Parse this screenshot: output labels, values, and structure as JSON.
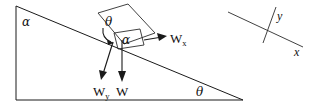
{
  "figure": {
    "background_color": "#ffffff",
    "stroke_color": "#1a1a1a",
    "width": 322,
    "height": 112
  },
  "incline": {
    "name": "inclined-plane-triangle",
    "apex_angle_label": "α",
    "base_angle_label": "θ",
    "vertices": {
      "top_left": [
        16,
        6
      ],
      "bottom_left": [
        16,
        100
      ],
      "bottom_right": [
        243,
        100
      ]
    }
  },
  "block": {
    "name": "block-on-incline",
    "inner_angle_label": "α",
    "top_angle_label": "θ"
  },
  "vectors": [
    {
      "id": "wx",
      "label": "W",
      "subscript": "x",
      "description": "weight component parallel to incline"
    },
    {
      "id": "wy",
      "label": "W",
      "subscript": "y",
      "description": "weight component perpendicular to incline"
    },
    {
      "id": "w",
      "label": "W",
      "subscript": "",
      "description": "weight vector pointing vertically downward"
    }
  ],
  "axes": {
    "name": "tilted-coordinate-axes",
    "x_label": "x",
    "y_label": "y"
  }
}
